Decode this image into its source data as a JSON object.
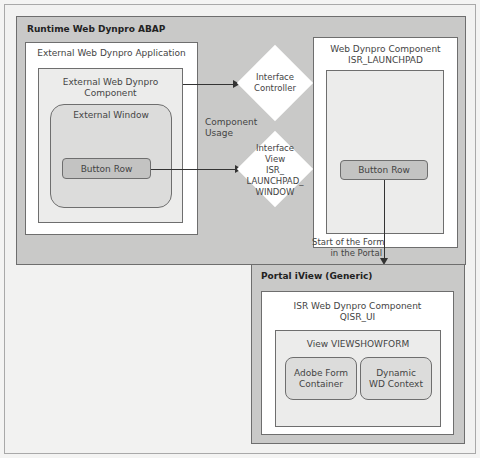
{
  "runtime": {
    "title": "Runtime Web Dynpro ABAP",
    "external_app": {
      "title": "External Web Dynpro Application",
      "component": {
        "title": "External Web Dynpro Component",
        "window": {
          "title": "External Window",
          "button_row": "Button Row"
        }
      }
    },
    "component_usage": "Component\nUsage",
    "interface_controller": "Interface\nController",
    "interface_view": "Interface\nView\nISR_\nLAUNCHPAD_\nWINDOW",
    "launchpad": {
      "title": "Web Dynpro Component\nISR_LAUNCHPAD",
      "button_row": "Button Row"
    }
  },
  "start_form": "Start of the Form\nin the Portal",
  "portal": {
    "title": "Portal iView (Generic)",
    "component": {
      "title": "ISR Web Dynpro Component\nQISR_UI",
      "view": {
        "title": "View VIEWSHOWFORM",
        "adobe": "Adobe Form\nContainer",
        "context": "Dynamic\nWD Context"
      }
    }
  },
  "colors": {
    "outer_gray": "#c9c9c8",
    "inner_light": "#ececeb",
    "button": "#c3c3c2",
    "border": "#6e6e6e",
    "background": "#f4f4f3"
  }
}
